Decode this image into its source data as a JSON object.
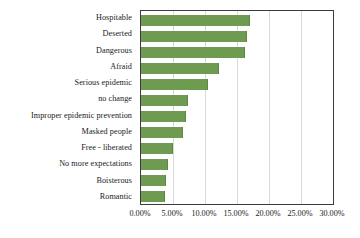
{
  "chart_data": {
    "type": "bar",
    "orientation": "horizontal",
    "title": "",
    "subtitle": "",
    "xlabel": "",
    "ylabel": "",
    "xlim": [
      0,
      0.3
    ],
    "grid": true,
    "legend": false,
    "legend_position": "none",
    "bar_color": "#6e9b50",
    "axis_color": "#3c3c3c",
    "gridline_color": "#d9d9d9",
    "tick_format": "percent-2dp",
    "xticks": [
      0,
      0.05,
      0.1,
      0.15,
      0.2,
      0.25,
      0.3
    ],
    "xtick_labels": [
      "0.00%",
      "5.00%",
      "10.00%",
      "15.00%",
      "20.00%",
      "25.00%",
      "30.00%"
    ],
    "categories": [
      "Hospitable",
      "Deserted",
      "Dangerous",
      "Afraid",
      "Serious epidemic",
      "no change",
      "Improper epidemic prevention",
      "Masked people",
      "Free - liberated",
      "No more expectations",
      "Boisterous",
      "Romantic"
    ],
    "values": [
      0.17,
      0.165,
      0.162,
      0.122,
      0.105,
      0.074,
      0.071,
      0.066,
      0.05,
      0.042,
      0.039,
      0.037
    ],
    "value_labels": [
      "17.00%",
      "16.50%",
      "16.20%",
      "12.20%",
      "10.50%",
      "7.40%",
      "7.10%",
      "6.60%",
      "5.00%",
      "4.20%",
      "3.90%",
      "3.70%"
    ]
  }
}
